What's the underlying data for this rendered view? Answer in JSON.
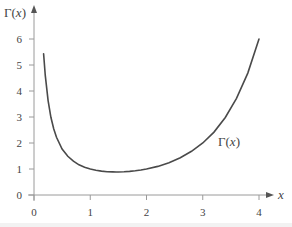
{
  "chart_data": {
    "type": "line",
    "title": "",
    "xlabel": "x",
    "ylabel": "Γ(x)",
    "curve_label": "Γ(x)",
    "xlim": [
      0,
      4.3
    ],
    "ylim": [
      0,
      6.5
    ],
    "xticks": [
      0,
      1,
      2,
      3,
      4
    ],
    "xtick_labels": [
      "0",
      "1",
      "2",
      "3",
      "4"
    ],
    "yticks": [
      0,
      1,
      2,
      3,
      4,
      5,
      6
    ],
    "ytick_labels": [
      "0",
      "1",
      "2",
      "3",
      "4",
      "5",
      "6"
    ],
    "grid": false,
    "legend": "none",
    "series": [
      {
        "name": "Γ(x)",
        "x": [
          0.17,
          0.2,
          0.25,
          0.3,
          0.35,
          0.4,
          0.5,
          0.6,
          0.7,
          0.8,
          0.9,
          1.0,
          1.1,
          1.2,
          1.3,
          1.4,
          1.46,
          1.5,
          1.6,
          1.7,
          1.8,
          1.9,
          2.0,
          2.2,
          2.4,
          2.6,
          2.8,
          3.0,
          3.2,
          3.4,
          3.6,
          3.8,
          4.0
        ],
        "values": [
          5.43,
          4.59,
          3.63,
          2.99,
          2.55,
          2.22,
          1.77,
          1.49,
          1.3,
          1.16,
          1.07,
          1.0,
          0.951,
          0.918,
          0.897,
          0.887,
          0.886,
          0.886,
          0.894,
          0.909,
          0.931,
          0.962,
          1.0,
          1.1,
          1.24,
          1.43,
          1.68,
          2.0,
          2.42,
          2.98,
          3.72,
          4.69,
          6.0
        ]
      }
    ]
  },
  "colors": {
    "axis": "#9a9a9a",
    "curve": "#4a4a4a",
    "text": "#444444"
  }
}
